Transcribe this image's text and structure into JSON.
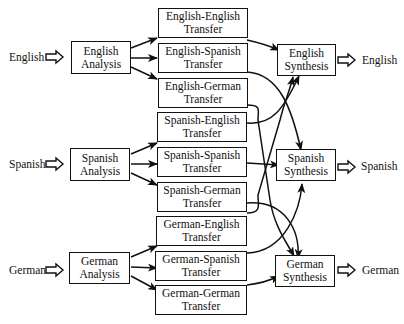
{
  "inputs": [
    {
      "label": "English"
    },
    {
      "label": "Spanish"
    },
    {
      "label": "German"
    }
  ],
  "outputs": [
    {
      "label": "English"
    },
    {
      "label": "Spanish"
    },
    {
      "label": "German"
    }
  ],
  "analysis": [
    {
      "line1": "English",
      "line2": "Analysis"
    },
    {
      "line1": "Spanish",
      "line2": "Analysis"
    },
    {
      "line1": "German",
      "line2": "Analysis"
    }
  ],
  "synthesis": [
    {
      "line1": "English",
      "line2": "Synthesis"
    },
    {
      "line1": "Spanish",
      "line2": "Synthesis"
    },
    {
      "line1": "German",
      "line2": "Synthesis"
    }
  ],
  "transfer": [
    {
      "line1": "English-English",
      "line2": "Transfer"
    },
    {
      "line1": "English-Spanish",
      "line2": "Transfer"
    },
    {
      "line1": "English-German",
      "line2": "Transfer"
    },
    {
      "line1": "Spanish-English",
      "line2": "Transfer"
    },
    {
      "line1": "Spanish-Spanish",
      "line2": "Transfer"
    },
    {
      "line1": "Spanish-German",
      "line2": "Transfer"
    },
    {
      "line1": "German-English",
      "line2": "Transfer"
    },
    {
      "line1": "German-Spanish",
      "line2": "Transfer"
    },
    {
      "line1": "German-German",
      "line2": "Transfer"
    }
  ]
}
